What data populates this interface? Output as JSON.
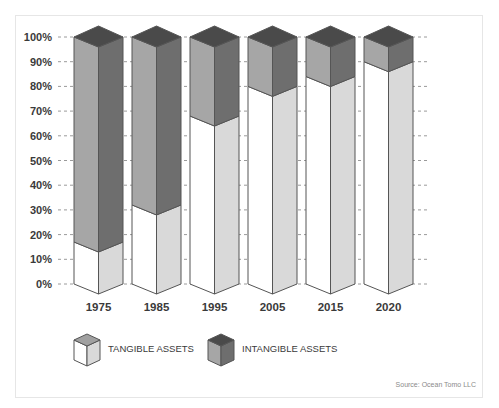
{
  "chart_data": {
    "type": "bar",
    "subtype": "stacked-100-percent-3d",
    "title": "",
    "xlabel": "",
    "ylabel": "",
    "categories": [
      "1975",
      "1985",
      "1995",
      "2005",
      "2015",
      "2020"
    ],
    "series": [
      {
        "name": "TANGIBLE ASSETS",
        "values": [
          17,
          32,
          68,
          80,
          84,
          90
        ]
      },
      {
        "name": "INTANGIBLE ASSETS",
        "values": [
          83,
          68,
          32,
          20,
          16,
          10
        ]
      }
    ],
    "ylim": [
      0,
      100
    ],
    "yticks": [
      "0%",
      "10%",
      "20%",
      "30%",
      "40%",
      "50%",
      "60%",
      "70%",
      "80%",
      "90%",
      "100%"
    ],
    "grid": "horizontal dashed",
    "legend_position": "bottom-left",
    "source": "Source: Ocean Tomo LLC"
  },
  "colors": {
    "tangible_left": "#ffffff",
    "tangible_right": "#d9d9d9",
    "intangible_left": "#a6a6a6",
    "intangible_right": "#6e6e6e",
    "top": "#4a4a4a",
    "edge": "#555555",
    "tangible_top_legend": "#a0a0a0"
  },
  "legend": {
    "tangible_label": "TANGIBLE ASSETS",
    "intangible_label": "INTANGIBLE ASSETS"
  },
  "source_text": "Source: Ocean Tomo LLC"
}
